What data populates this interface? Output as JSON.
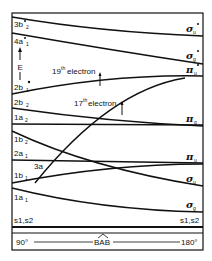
{
  "diagram": {
    "type": "walsh-correlation-diagram",
    "axis": {
      "left_label": "90°",
      "center_label": "BAB",
      "right_label": "180°",
      "energy_label": "E"
    },
    "left_orbitals": [
      "3b2",
      "4a1",
      "2b1",
      "2b2",
      "1a2",
      "1b2",
      "2a1",
      "3a",
      "1b1",
      "1a1",
      "s1,s2"
    ],
    "left_labels": [
      {
        "id": "3b2",
        "main": "3b",
        "sub": "2",
        "star": true
      },
      {
        "id": "4a1",
        "main": "4a",
        "sub": "1",
        "star": true
      },
      {
        "id": "2b1",
        "main": "2b",
        "sub": "1",
        "star": true
      },
      {
        "id": "2b2",
        "main": "2b",
        "sub": "2",
        "star": false
      },
      {
        "id": "1a2",
        "main": "1a",
        "sub": "2",
        "star": false
      },
      {
        "id": "1b2",
        "main": "1b",
        "sub": "2",
        "star": false
      },
      {
        "id": "2a1",
        "main": "2a",
        "sub": "1",
        "star": false
      },
      {
        "id": "3a",
        "main": "3a",
        "sub": "",
        "star": false
      },
      {
        "id": "1b1",
        "main": "1b",
        "sub": "1",
        "star": false
      },
      {
        "id": "1a1",
        "main": "1a",
        "sub": "1",
        "star": false
      },
      {
        "id": "s1s2_left",
        "main": "s1,s2",
        "sub": "",
        "star": false
      }
    ],
    "right_labels": [
      {
        "id": "sigma_u_star",
        "main": "σ",
        "sub": "u",
        "star": true
      },
      {
        "id": "sigma_g_star",
        "main": "σ",
        "sub": "g",
        "star": true
      },
      {
        "id": "pi_u_star",
        "main": "π",
        "sub": "u",
        "star": true
      },
      {
        "id": "pi_g",
        "main": "π",
        "sub": "g",
        "star": false
      },
      {
        "id": "pi_u",
        "main": "π",
        "sub": "u",
        "star": false
      },
      {
        "id": "sigma_u",
        "main": "σ",
        "sub": "u",
        "star": false
      },
      {
        "id": "sigma_g",
        "main": "σ",
        "sub": "g",
        "star": false
      },
      {
        "id": "s1s2_right",
        "main": "s1,s2",
        "sub": "",
        "star": false
      }
    ],
    "correlations": [
      {
        "from": "3b2",
        "to": "σu*"
      },
      {
        "from": "4a1",
        "to": "σg*"
      },
      {
        "from": "2b1",
        "to": "πu*"
      },
      {
        "from": "2b2",
        "to": "πg"
      },
      {
        "from": "1a2",
        "to": "πg"
      },
      {
        "from": "1b2",
        "to": "σu"
      },
      {
        "from": "2a1",
        "to": "πu"
      },
      {
        "from": "3a",
        "to": "πu*"
      },
      {
        "from": "1b1",
        "to": "πu"
      },
      {
        "from": "1a1",
        "to": "σg"
      },
      {
        "from": "s1,s2",
        "to": "s1,s2"
      }
    ],
    "annotations": [
      {
        "id": "electron19",
        "text_pre": "19",
        "sup": "th",
        "text_post": "electron"
      },
      {
        "id": "electron17",
        "text_pre": "17",
        "sup": "th",
        "text_post": "electron"
      }
    ]
  }
}
